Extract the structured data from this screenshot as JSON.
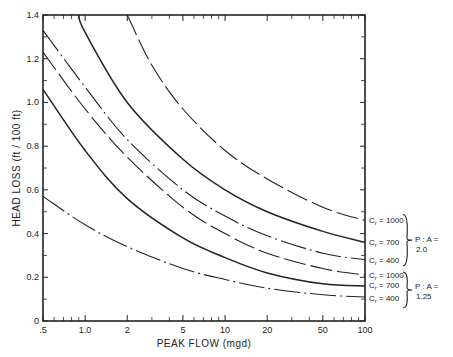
{
  "chart_data": {
    "type": "line",
    "title": "",
    "xlabel": "PEAK FLOW (mgd)",
    "ylabel": "HEAD LOSS (ft / 100 ft)",
    "xscale": "log",
    "xlim": [
      0.5,
      100
    ],
    "ylim": [
      0,
      1.4
    ],
    "grid": false,
    "x_ticks": [
      {
        "value": 0.5,
        "label": ".5"
      },
      {
        "value": 1,
        "label": "1.0"
      },
      {
        "value": 2,
        "label": "2"
      },
      {
        "value": 5,
        "label": "5"
      },
      {
        "value": 10,
        "label": "10"
      },
      {
        "value": 20,
        "label": "20"
      },
      {
        "value": 50,
        "label": "50"
      },
      {
        "value": 100,
        "label": "100"
      }
    ],
    "x_minor_ticks": [
      0.6,
      0.7,
      0.8,
      0.9,
      3,
      4,
      6,
      7,
      8,
      9,
      30,
      40,
      60,
      70,
      80,
      90
    ],
    "y_ticks": [
      {
        "value": 0,
        "label": "0"
      },
      {
        "value": 0.2,
        "label": "0.2"
      },
      {
        "value": 0.4,
        "label": "0.4"
      },
      {
        "value": 0.6,
        "label": "0.6"
      },
      {
        "value": 0.8,
        "label": "0.8"
      },
      {
        "value": 1.0,
        "label": "1.0"
      },
      {
        "value": 1.2,
        "label": "1.2"
      },
      {
        "value": 1.4,
        "label": "1.4"
      }
    ],
    "y_minor_ticks": [
      0.1,
      0.3,
      0.5,
      0.7,
      0.9,
      1.1,
      1.3
    ],
    "series": [
      {
        "name": "Cr = 1000, P:A = 2.0",
        "style": "long-dash",
        "x": [
          2,
          3,
          5,
          10,
          20,
          50,
          100
        ],
        "values": [
          1.4,
          1.17,
          0.97,
          0.78,
          0.65,
          0.52,
          0.46
        ]
      },
      {
        "name": "Cr = 700, P:A = 2.0",
        "style": "solid",
        "x": [
          0.9,
          1,
          2,
          5,
          10,
          20,
          50,
          100
        ],
        "values": [
          1.4,
          1.32,
          1.0,
          0.74,
          0.6,
          0.5,
          0.41,
          0.36
        ]
      },
      {
        "name": "Cr = 400, P:A = 2.0",
        "style": "dash-dot",
        "x": [
          0.5,
          1,
          2,
          5,
          10,
          20,
          50,
          100
        ],
        "values": [
          1.33,
          1.07,
          0.83,
          0.6,
          0.48,
          0.39,
          0.31,
          0.28
        ]
      },
      {
        "name": "Cr = 1000, P:A = 1.25",
        "style": "long-dash",
        "x": [
          0.5,
          1,
          2,
          5,
          10,
          20,
          50,
          100
        ],
        "values": [
          1.23,
          0.97,
          0.75,
          0.52,
          0.4,
          0.31,
          0.24,
          0.21
        ]
      },
      {
        "name": "Cr = 700, P:A = 1.25",
        "style": "solid",
        "x": [
          0.5,
          1,
          2,
          5,
          10,
          20,
          50,
          100
        ],
        "values": [
          1.06,
          0.78,
          0.56,
          0.38,
          0.29,
          0.22,
          0.17,
          0.16
        ]
      },
      {
        "name": "Cr = 400, P:A = 1.25",
        "style": "dash-dot",
        "x": [
          0.5,
          1,
          2,
          5,
          10,
          20,
          50,
          100
        ],
        "values": [
          0.57,
          0.44,
          0.34,
          0.24,
          0.19,
          0.15,
          0.12,
          0.11
        ]
      }
    ],
    "annotations": [
      {
        "text": "Cr = 1000",
        "group": "P:A = 2.0"
      },
      {
        "text": "Cr = 700",
        "group": "P:A = 2.0"
      },
      {
        "text": "Cr = 400",
        "group": "P:A = 2.0"
      },
      {
        "text": "Cr = 1000",
        "group": "P:A = 1.25"
      },
      {
        "text": "Cr = 700",
        "group": "P:A = 1.25"
      },
      {
        "text": "Cr = 400",
        "group": "P:A = 1.25"
      }
    ],
    "group_labels": [
      {
        "line1": "P : A =",
        "line2": "2.0"
      },
      {
        "line1": "P : A =",
        "line2": "1.25"
      }
    ]
  }
}
